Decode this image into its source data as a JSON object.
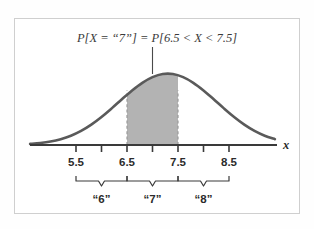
{
  "figure": {
    "title_equation": "P[X = “7”] = P[6.5 < X < 7.5]",
    "axis_label_x": "x",
    "frame_color": "#cfcfcf",
    "curve_color": "#5a5a5a",
    "shade_color": "#b3b3b3",
    "axis_color": "#3a3a3a"
  },
  "chart_data": {
    "type": "area",
    "title": "P[X = “7”] = P[6.5 < X < 7.5]",
    "xlabel": "x",
    "ylabel": "",
    "curve": "normal density",
    "mean": 7.0,
    "std_dev": 0.85,
    "xlim": [
      4.6,
      9.4
    ],
    "ylim": [
      0,
      1.0
    ],
    "grid": false,
    "legend": "none",
    "shaded_interval": {
      "lower": 6.5,
      "upper": 7.5,
      "fill": "#b3b3b3",
      "boundary_style": "dashed"
    },
    "peak_marker": {
      "x": 7.0,
      "description": "vertical leader line from equation to curve peak"
    },
    "tick_values": [
      5.5,
      6.0,
      6.5,
      7.0,
      7.5,
      8.0,
      8.5
    ],
    "tick_labels": [
      "5.5",
      "",
      "6.5",
      "",
      "7.5",
      "",
      "8.5"
    ],
    "labeled_ticks": [
      "5.5",
      "6.5",
      "7.5",
      "8.5"
    ],
    "braces": [
      {
        "label": "“6”",
        "from": 5.5,
        "to": 6.5
      },
      {
        "label": "“7”",
        "from": 6.5,
        "to": 7.5
      },
      {
        "label": "“8”",
        "from": 7.5,
        "to": 8.5
      }
    ],
    "x": [
      4.6,
      4.8,
      5.0,
      5.2,
      5.4,
      5.6,
      5.8,
      6.0,
      6.2,
      6.4,
      6.6,
      6.8,
      7.0,
      7.2,
      7.4,
      7.6,
      7.8,
      8.0,
      8.2,
      8.4,
      8.6,
      8.8,
      9.0,
      9.2,
      9.4
    ],
    "y": [
      0.012,
      0.022,
      0.038,
      0.064,
      0.102,
      0.155,
      0.224,
      0.308,
      0.403,
      0.503,
      0.6,
      0.684,
      0.746,
      0.781,
      0.781,
      0.746,
      0.684,
      0.6,
      0.503,
      0.403,
      0.308,
      0.224,
      0.155,
      0.102,
      0.064
    ]
  }
}
